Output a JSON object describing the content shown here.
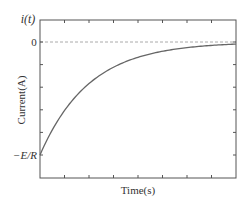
{
  "chart_data": {
    "type": "line",
    "title": "",
    "xlabel": "Time(s)",
    "ylabel": "Current(A)",
    "y_axis_symbol": "i(t)",
    "y_tick_labels": [
      {
        "value": 0,
        "label": "0"
      },
      {
        "value": -1,
        "label": "−E/R"
      }
    ],
    "xlim": [
      0,
      8
    ],
    "ylim": [
      -1.4,
      0.2
    ],
    "grid": false,
    "legend": null,
    "reference_line": {
      "y": 0,
      "style": "dashed",
      "color": "#aaaaaa"
    },
    "x_ticks_count": 7,
    "y_ticks_count": 5,
    "series": [
      {
        "name": "i(t) = -(E/R) e^(-t/τ)",
        "color": "#666666",
        "tau": 2,
        "x": [
          0,
          0.5,
          1,
          1.5,
          2,
          3,
          4,
          5,
          6,
          7,
          8
        ],
        "y": [
          -1.0,
          -0.78,
          -0.61,
          -0.47,
          -0.37,
          -0.22,
          -0.14,
          -0.08,
          -0.05,
          -0.03,
          -0.02
        ]
      }
    ]
  },
  "labels": {
    "y_symbol": "i(t)",
    "zero": "0",
    "neg_e_over_r": "−E/R",
    "xlabel": "Time(s)",
    "ylabel": "Current(A)"
  },
  "colors": {
    "axis": "#555555",
    "curve": "#666666",
    "reference": "#aaaaaa"
  }
}
